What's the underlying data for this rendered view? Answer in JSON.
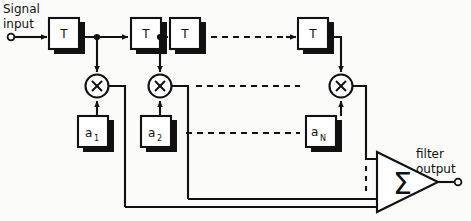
{
  "diagram": {
    "input_label": {
      "line1": "Signal",
      "line2": "input"
    },
    "output_label": {
      "line1": "filter",
      "line2": "output"
    },
    "delay_label": "T",
    "multiplier_label": "X",
    "summer_label": "Σ",
    "coefficients": [
      {
        "base": "a",
        "sub": "1"
      },
      {
        "base": "a",
        "sub": "2"
      },
      {
        "base": "a",
        "sub": "N"
      }
    ],
    "delay_blocks": [
      {
        "label": "T"
      },
      {
        "label": "T"
      },
      {
        "label": "T"
      },
      {
        "label": "T"
      }
    ],
    "multipliers": [
      {
        "label": "X"
      },
      {
        "label": "X"
      },
      {
        "label": "X"
      }
    ],
    "colors": {
      "ink": "#111111",
      "paper": "#fbfbf9",
      "box_face": "#ffffff",
      "shadow": "#111111"
    }
  }
}
